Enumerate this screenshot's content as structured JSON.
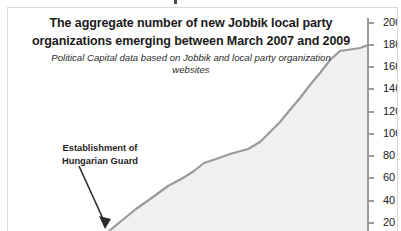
{
  "chart_frame": {
    "border_color": "#d9d9d9",
    "background": "#ffffff"
  },
  "annotation": {
    "line1": "Establishment of",
    "line2": "Hungarian Guard",
    "arrow": "annotation-arrow"
  },
  "chart_data": {
    "type": "area",
    "title": "The aggregate number of new Jobbik local party organizations emerging between March 2007 and 2009",
    "title_line1": "The aggregate number of new Jobbik local party",
    "title_line2": "organizations emerging between March 2007 and 2009",
    "subtitle": "Political Capital data based on Jobbik and local party organization websites",
    "xlabel": "",
    "ylabel": "",
    "ylim": [
      0,
      200
    ],
    "ytick_labels": [
      "200",
      "180",
      "160",
      "140",
      "120",
      "100",
      "80",
      "60",
      "40",
      "20"
    ],
    "ytick_values": [
      200,
      180,
      160,
      140,
      120,
      100,
      80,
      60,
      40,
      20
    ],
    "grid": false,
    "legend": "none",
    "axis_position": "right",
    "line_color": "#9a9a9a",
    "fill_color": "#f0f0f0",
    "series": [
      {
        "name": "Aggregate new Jobbik local party organizations",
        "x": [
          0,
          1,
          2,
          3,
          4,
          5,
          6,
          7,
          8,
          9,
          10,
          11,
          12,
          13,
          14,
          15,
          16
        ],
        "values": [
          2,
          5,
          9,
          15,
          22,
          30,
          40,
          52,
          58,
          62,
          70,
          82,
          98,
          118,
          140,
          162,
          176
        ]
      }
    ],
    "note": "Curve visible only in right portion of crop; rises from near zero at left to ~180 at the right axis."
  }
}
